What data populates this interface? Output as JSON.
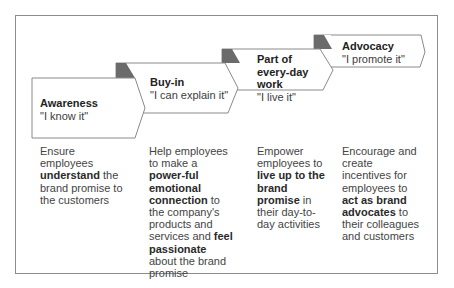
{
  "diagram": {
    "type": "staircase-chevron-process",
    "colors": {
      "frame_border": "#8c8c8c",
      "chevron_fill": "#ffffff",
      "chevron_border": "#8a8a8a",
      "fold_triangle": "#6b6b6b",
      "text": "#3a3a3a"
    },
    "stages": [
      {
        "title": "Awareness",
        "quote": "\"I know it\"",
        "description": [
          {
            "text": "Ensure employees ",
            "bold": false
          },
          {
            "text": "understand",
            "bold": true
          },
          {
            "text": " the brand promise to the customers",
            "bold": false
          }
        ]
      },
      {
        "title": "Buy-in",
        "quote": "\"I can explain it\"",
        "description": [
          {
            "text": "Help employees to make a ",
            "bold": false
          },
          {
            "text": "power-ful emotional connection",
            "bold": true
          },
          {
            "text": " to the company's products and services and ",
            "bold": false
          },
          {
            "text": "feel passionate",
            "bold": true
          },
          {
            "text": " about the brand promise",
            "bold": false
          }
        ]
      },
      {
        "title": "Part of every-day work",
        "quote": "\"I live it\"",
        "description": [
          {
            "text": "Empower employees to ",
            "bold": false
          },
          {
            "text": "live up to the brand promise",
            "bold": true
          },
          {
            "text": " in their day-to-day activities",
            "bold": false
          }
        ]
      },
      {
        "title": "Advocacy",
        "quote": "\"I promote it\"",
        "description": [
          {
            "text": "Encourage and create incentives for employees to ",
            "bold": false
          },
          {
            "text": "act as brand advocates",
            "bold": true
          },
          {
            "text": " to their colleagues and customers",
            "bold": false
          }
        ]
      }
    ]
  }
}
